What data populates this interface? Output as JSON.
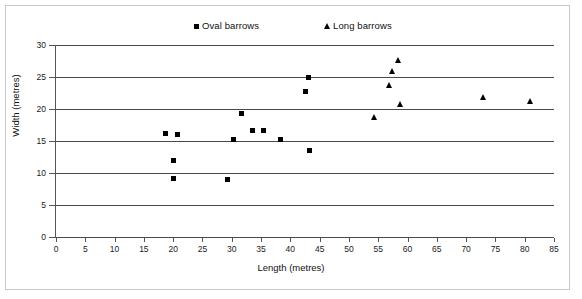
{
  "chart_data": {
    "type": "scatter",
    "title": "",
    "xlabel": "Length (metres)",
    "ylabel": "Width (metres)",
    "xlim": [
      0,
      85
    ],
    "ylim": [
      0,
      30
    ],
    "xticks": [
      0,
      5,
      10,
      15,
      20,
      25,
      30,
      35,
      40,
      45,
      50,
      55,
      60,
      65,
      70,
      75,
      80,
      85
    ],
    "yticks": [
      0,
      5,
      10,
      15,
      20,
      25,
      30
    ],
    "xtick_labels": [
      "0",
      "5",
      "10",
      "15",
      "20",
      "25",
      "30",
      "35",
      "40",
      "45",
      "50",
      "55",
      "60",
      "65",
      "70",
      "75",
      "80",
      "85"
    ],
    "ytick_labels": [
      "0",
      "5",
      "10",
      "15",
      "20",
      "25",
      "30"
    ],
    "grid": "horizontal",
    "legend_position": "top",
    "marker_color": "#000000",
    "gridline_color": "#4a4a4a",
    "series": [
      {
        "name": "Oval barrows",
        "marker": "square",
        "points": [
          {
            "x": 18.7,
            "y": 16.1
          },
          {
            "x": 20.8,
            "y": 16.0
          },
          {
            "x": 20.0,
            "y": 12.0
          },
          {
            "x": 20.0,
            "y": 9.2
          },
          {
            "x": 29.2,
            "y": 9.0
          },
          {
            "x": 30.3,
            "y": 15.2
          },
          {
            "x": 31.6,
            "y": 19.3
          },
          {
            "x": 33.6,
            "y": 16.6
          },
          {
            "x": 35.5,
            "y": 16.6
          },
          {
            "x": 38.4,
            "y": 15.2
          },
          {
            "x": 42.6,
            "y": 22.7
          },
          {
            "x": 43.1,
            "y": 25.0
          },
          {
            "x": 43.2,
            "y": 13.5
          }
        ]
      },
      {
        "name": "Long barrows",
        "marker": "triangle",
        "points": [
          {
            "x": 54.3,
            "y": 18.7
          },
          {
            "x": 56.9,
            "y": 23.7
          },
          {
            "x": 57.4,
            "y": 25.9
          },
          {
            "x": 58.4,
            "y": 27.7
          },
          {
            "x": 58.8,
            "y": 20.8
          },
          {
            "x": 73.0,
            "y": 21.8
          },
          {
            "x": 81.0,
            "y": 21.2
          }
        ]
      }
    ]
  },
  "legend": {
    "entries": [
      {
        "label": "Oval barrows",
        "marker": "square-marker-icon"
      },
      {
        "label": "Long barrows",
        "marker": "triangle-marker-icon"
      }
    ]
  }
}
